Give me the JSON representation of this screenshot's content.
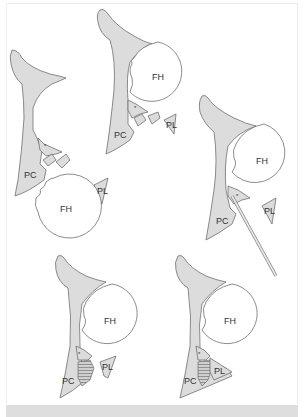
{
  "figure": {
    "colors": {
      "bone_fill": "#dcdcdc",
      "outline": "#6e6e6e",
      "background": "#ffffff",
      "bottom_band": "#dedede"
    },
    "panels": [
      {
        "id": "panel-1",
        "labels": {
          "pc": "PC",
          "fh": "FH",
          "pl": "PL",
          "marker": "*"
        },
        "state": "femoral head dislocated, wall fragments displaced"
      },
      {
        "id": "panel-2",
        "labels": {
          "pc": "PC",
          "fh": "FH",
          "pl": "PL",
          "marker": "*"
        },
        "state": "femoral head reduced, fragments displaced"
      },
      {
        "id": "panel-3",
        "labels": {
          "pc": "PC",
          "fh": "FH",
          "pl": "PL",
          "marker": "*"
        },
        "state": "fragment elevated with instrument"
      },
      {
        "id": "panel-4",
        "labels": {
          "pc": "PC",
          "fh": "FH",
          "pl": "PL",
          "marker": "*"
        },
        "state": "bone graft (hatched) placed"
      },
      {
        "id": "panel-5",
        "labels": {
          "pc": "PC",
          "fh": "FH",
          "pl": "PL",
          "marker": "*"
        },
        "state": "posterior lip reduced over graft"
      }
    ]
  }
}
